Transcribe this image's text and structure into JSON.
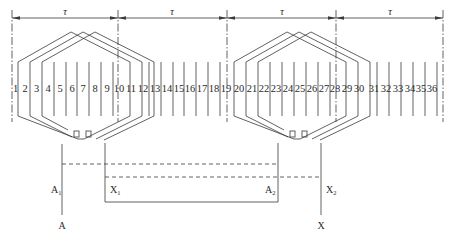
{
  "diagram": {
    "type": "stator winding expansion diagram",
    "pole_pitch_label": "τ",
    "pole_pitch_marks": [
      {
        "label": "τ",
        "from_slot": 1,
        "to_slot": 10
      },
      {
        "label": "τ",
        "from_slot": 10,
        "to_slot": 19
      },
      {
        "label": "τ",
        "from_slot": 19,
        "to_slot": 28
      },
      {
        "label": "τ",
        "from_slot": 28,
        "to_slot": 36
      }
    ],
    "slot_count": 36,
    "slots": [
      "1",
      "2",
      "3",
      "4",
      "5",
      "6",
      "7",
      "8",
      "9",
      "10",
      "11",
      "12",
      "13",
      "14",
      "15",
      "16",
      "17",
      "18",
      "19",
      "20",
      "21",
      "22",
      "23",
      "24",
      "25",
      "26",
      "27",
      "28",
      "29",
      "30",
      "31",
      "32",
      "33",
      "34",
      "35",
      "36"
    ],
    "coil_groups": [
      {
        "name": "group-1",
        "coils": 3,
        "start_label": "A",
        "start_sub": "1",
        "end_label": "X",
        "end_sub": "1"
      },
      {
        "name": "group-2",
        "coils": 3,
        "start_label": "A",
        "start_sub": "2",
        "end_label": "X",
        "end_sub": "2"
      }
    ],
    "terminals": {
      "A1": {
        "main": "A",
        "sub": "1"
      },
      "X1": {
        "main": "X",
        "sub": "1"
      },
      "A2": {
        "main": "A",
        "sub": "2"
      },
      "X2": {
        "main": "X",
        "sub": "2"
      },
      "A": "A",
      "X": "X"
    },
    "colors": {
      "line": "#3a3a3a",
      "text": "#2a2a2a",
      "background": "#ffffff"
    }
  }
}
